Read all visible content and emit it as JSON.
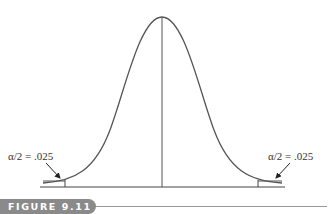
{
  "figure": {
    "caption": "FIGURE 9.11",
    "left_tail_label": "α/2 = .025",
    "right_tail_label": "α/2 = .025",
    "curve_type": "normal distribution (two-tailed rejection regions)",
    "colors": {
      "curve": "#555555",
      "axis": "#444444",
      "caption_tab": "#8a8a8a",
      "caption_text": "#ffffff"
    }
  }
}
